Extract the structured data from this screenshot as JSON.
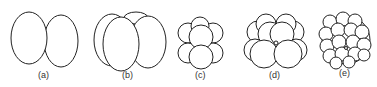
{
  "figure": {
    "panels": [
      {
        "label": "(a)",
        "cells": 2
      },
      {
        "label": "(b)",
        "cells": 4
      },
      {
        "label": "(c)",
        "cells": 8
      },
      {
        "label": "(d)",
        "cells": 16
      },
      {
        "label": "(e)",
        "cells": 32
      }
    ]
  },
  "colors": {
    "stroke": "#222222",
    "fill": "#ffffff"
  }
}
